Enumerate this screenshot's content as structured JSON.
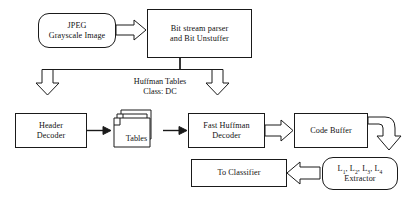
{
  "diagram": {
    "background_color": "#ffffff",
    "line_color": "#1a1a1a",
    "nodes": {
      "jpeg_input": {
        "line1": "JPEG",
        "line2": "Grayscale Image",
        "shape": "rounded-rectangle"
      },
      "bit_stream_parser": {
        "line1": "Bit stream parser",
        "line2": "and Bit Unstuffer",
        "shape": "rectangle"
      },
      "header_decoder": {
        "line1": "Header",
        "line2": "Decoder",
        "shape": "rectangle"
      },
      "tables": {
        "label": "Tables",
        "shape": "document-stack"
      },
      "fast_huffman_decoder": {
        "line1": "Fast Huffman",
        "line2": "Decoder",
        "shape": "rectangle"
      },
      "code_buffer": {
        "line1": "Code Buffer",
        "shape": "rectangle"
      },
      "extractor": {
        "line1_html": "L<sub>1</sub>, L<sub>2</sub>, L<sub>3</sub>, L<sub>4</sub>",
        "line2": "Extractor",
        "shape": "rounded-rectangle"
      },
      "to_classifier": {
        "line1": "To Classifier",
        "shape": "rectangle"
      }
    },
    "labels": {
      "huffman_tables": "Huffman Tables",
      "huffman_class": "Class: DC"
    },
    "connectors": [
      {
        "name": "jpeg-to-parser",
        "style": "block-arrow",
        "direction": "right"
      },
      {
        "name": "parser-bus-down-left",
        "style": "block-arrow",
        "direction": "down"
      },
      {
        "name": "parser-bus-down-right",
        "style": "block-arrow",
        "direction": "down"
      },
      {
        "name": "header-decoder-to-tables",
        "style": "line-arrow",
        "direction": "right"
      },
      {
        "name": "tables-to-fast-huffman-decoder",
        "style": "line-arrow",
        "direction": "right"
      },
      {
        "name": "fast-huffman-decoder-to-code-buffer",
        "style": "block-arrow",
        "direction": "right"
      },
      {
        "name": "code-buffer-to-extractor",
        "style": "curved-block-arrow",
        "direction": "down"
      },
      {
        "name": "extractor-to-classifier",
        "style": "block-arrow",
        "direction": "left"
      }
    ]
  }
}
